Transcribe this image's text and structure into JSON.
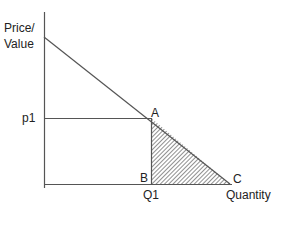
{
  "diagram": {
    "type": "consumer-surplus / demand diagram",
    "y_axis_label_line1": "Price/",
    "y_axis_label_line2": "Value",
    "x_axis_label": "Quantity",
    "price_label": "p1",
    "quantity_label": "Q1",
    "points": {
      "A": "A",
      "B": "B",
      "C": "C"
    },
    "shaded_region": "triangle ABC (hatched)",
    "colors": {
      "line": "#555555",
      "hatch": "#444444",
      "text": "#222222"
    }
  }
}
